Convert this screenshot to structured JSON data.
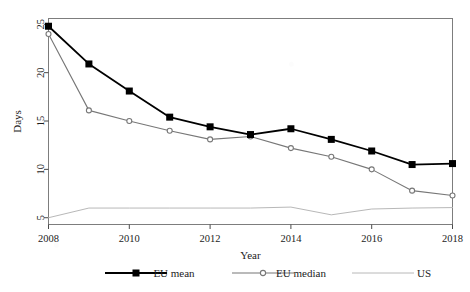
{
  "figure": {
    "background": "#ffffff",
    "frame_color": "#7d7d7d"
  },
  "chart_data": {
    "type": "line",
    "title": "",
    "xlabel": "Year",
    "ylabel": "Days",
    "x": [
      2008,
      2009,
      2010,
      2011,
      2012,
      2013,
      2014,
      2015,
      2016,
      2017,
      2018
    ],
    "xlim": [
      2008,
      2018
    ],
    "ylim": [
      4.3,
      25.6
    ],
    "xticks": [
      2008,
      2010,
      2012,
      2014,
      2016,
      2018
    ],
    "xtick_labels": [
      "2008",
      "2010",
      "2012",
      "2014",
      "2016",
      "2018"
    ],
    "yticks": [
      5,
      10,
      15,
      20,
      25
    ],
    "ytick_labels": [
      "5",
      "10",
      "15",
      "20",
      "25"
    ],
    "grid": false,
    "legend_position": "bottom",
    "series": [
      {
        "name": "EU mean",
        "color": "#000000",
        "marker": "square",
        "marker_size": 7,
        "line_width": 1.8,
        "values": [
          24.8,
          20.9,
          18.1,
          15.4,
          14.4,
          13.6,
          14.2,
          13.1,
          11.9,
          10.5,
          10.6
        ]
      },
      {
        "name": "EU median",
        "color": "#777777",
        "marker": "circle",
        "marker_size": 5,
        "line_width": 1.1,
        "values": [
          24.0,
          16.1,
          15.0,
          14.0,
          13.1,
          13.4,
          12.2,
          11.3,
          10.0,
          7.8,
          7.3
        ]
      },
      {
        "name": "US",
        "color": "#b8b8b8",
        "marker": "none",
        "marker_size": 0,
        "line_width": 1.0,
        "values": [
          5.0,
          6.0,
          6.0,
          6.0,
          6.0,
          6.0,
          6.1,
          5.3,
          5.9,
          6.0,
          6.05
        ]
      }
    ]
  },
  "legend": {
    "items": [
      {
        "label": "EU mean",
        "color": "#000000",
        "marker": "square",
        "swatch_name": "legend-swatch-eu-mean"
      },
      {
        "label": "EU median",
        "color": "#777777",
        "marker": "circle",
        "swatch_name": "legend-swatch-eu-median"
      },
      {
        "label": "US",
        "color": "#b8b8b8",
        "marker": "none",
        "swatch_name": "legend-swatch-us"
      }
    ]
  }
}
